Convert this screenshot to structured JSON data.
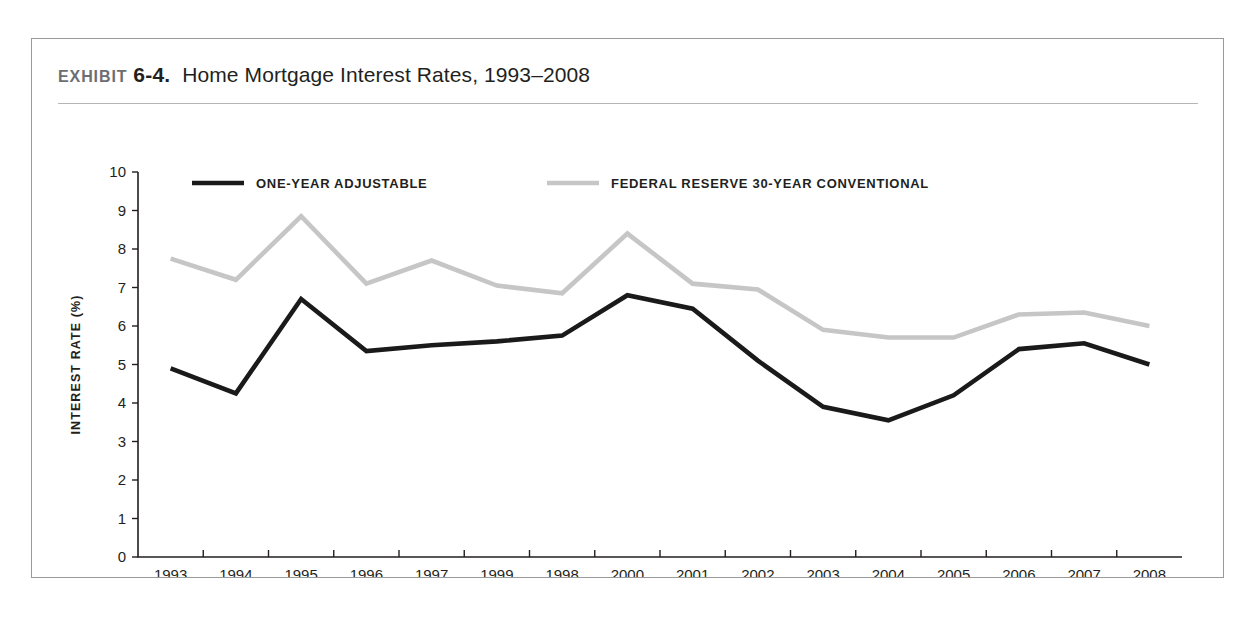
{
  "exhibit": {
    "kicker": "EXHIBIT",
    "number": "6-4.",
    "caption": "Home Mortgage Interest Rates, 1993–2008"
  },
  "chart_data": {
    "type": "line",
    "title": "Home Mortgage Interest Rates, 1993–2008",
    "xlabel": "YEAR",
    "ylabel": "INTEREST RATE (%)",
    "ylim": [
      0,
      10
    ],
    "ytick_step": 1,
    "yticks": [
      "0",
      "1",
      "2",
      "3",
      "4",
      "5",
      "6",
      "7",
      "8",
      "9",
      "10"
    ],
    "grid": false,
    "legend_position": "top-inside",
    "categories": [
      "1993",
      "1994",
      "1995",
      "1996",
      "1997",
      "1999",
      "1998",
      "2000",
      "2001",
      "2002",
      "2003",
      "2004",
      "2005",
      "2006",
      "2007",
      "2008"
    ],
    "series": [
      {
        "name": "ONE-YEAR ADJUSTABLE",
        "color": "#1a1a1a",
        "width": 4.6,
        "values": [
          4.9,
          4.25,
          6.7,
          5.35,
          5.5,
          5.6,
          5.75,
          6.8,
          6.45,
          5.1,
          3.9,
          3.55,
          4.2,
          5.4,
          5.55,
          5.0
        ]
      },
      {
        "name": "FEDERAL RESERVE 30-YEAR CONVENTIONAL",
        "color": "#c6c6c6",
        "width": 4.6,
        "values": [
          7.75,
          7.2,
          8.85,
          7.1,
          7.7,
          7.05,
          6.85,
          8.4,
          7.1,
          6.95,
          5.9,
          5.7,
          5.7,
          6.3,
          6.35,
          6.0
        ]
      }
    ]
  }
}
